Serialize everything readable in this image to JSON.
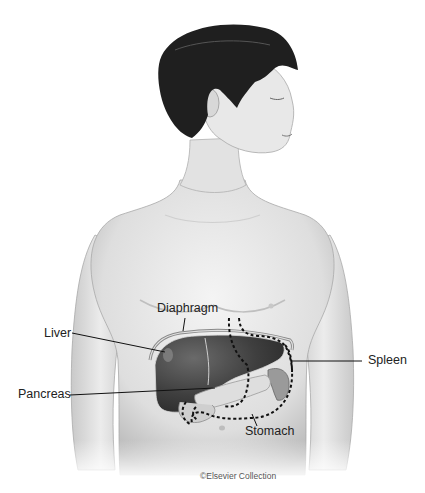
{
  "figure": {
    "labels": {
      "diaphragm": "Diaphragm",
      "liver": "Liver",
      "spleen": "Spleen",
      "pancreas": "Pancreas",
      "stomach": "Stomach"
    },
    "credit": "©Elsevier Collection",
    "colors": {
      "background": "#ffffff",
      "skin": "#e6e6e6",
      "skin_shadow": "#bdbdbd",
      "hair": "#1c1c1c",
      "liver": "#3e3e3e",
      "pancreas": "#dcdcdc",
      "leader_line": "#111111"
    }
  }
}
